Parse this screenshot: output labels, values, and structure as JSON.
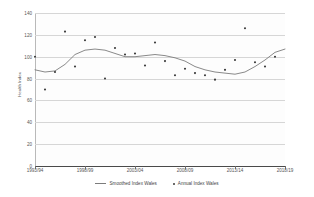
{
  "chart_data": {
    "type": "scatter",
    "title": "",
    "xlabel": "",
    "ylabel": "Health Index",
    "ylim": [
      0,
      140
    ],
    "yticks": [
      0,
      20,
      40,
      60,
      80,
      100,
      120,
      140
    ],
    "xticks": [
      "1993/94",
      "1998/99",
      "2003/04",
      "2008/09",
      "2013/14",
      "2018/19"
    ],
    "xlim": [
      "1993/94",
      "2018/19"
    ],
    "grid": true,
    "legend_position": "bottom",
    "x": [
      "1993/94",
      "1994/95",
      "1995/96",
      "1996/97",
      "1997/98",
      "1998/99",
      "1999/00",
      "2000/01",
      "2001/02",
      "2002/03",
      "2003/04",
      "2004/05",
      "2005/06",
      "2006/07",
      "2007/08",
      "2008/09",
      "2009/10",
      "2010/11",
      "2011/12",
      "2012/13",
      "2013/14",
      "2014/15",
      "2015/16",
      "2016/17",
      "2017/18",
      "2018/19"
    ],
    "series": [
      {
        "name": "Annual Index Wales",
        "type": "scatter",
        "marker": "dot",
        "color": "#3a3a3a",
        "values": [
          100,
          70,
          86,
          123,
          91,
          115,
          118,
          80,
          108,
          102,
          103,
          92,
          113,
          96,
          83,
          89,
          85,
          83,
          79,
          88,
          97,
          126,
          95,
          91,
          100,
          null
        ]
      },
      {
        "name": "Smoothed Index Wales",
        "type": "line",
        "color": "#7c7c7c",
        "values": [
          88,
          86,
          87,
          93,
          102,
          106,
          107,
          106,
          103,
          100,
          100,
          101,
          102,
          101,
          99,
          96,
          91,
          88,
          86,
          85,
          84,
          86,
          91,
          97,
          104,
          107
        ]
      }
    ]
  },
  "legend": {
    "items": [
      {
        "label": "Smoothed Index Wales",
        "marker": "line"
      },
      {
        "label": "Annual Index Wales",
        "marker": "dot"
      }
    ]
  },
  "colors": {
    "line": "#7c7c7c",
    "marker": "#3a3a3a",
    "grid": "#d6d6d6",
    "axis": "#6a6a6a",
    "text": "#555555",
    "plot_background": "#fdfdfd"
  }
}
